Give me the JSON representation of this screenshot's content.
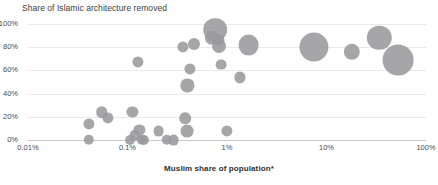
{
  "chart_data": {
    "type": "scatter",
    "title": "Share of Islamic architecture removed",
    "xlabel": "Muslim share of population*",
    "ylabel": "Share of Islamic architecture removed",
    "xscale": "log",
    "xlim": [
      0.01,
      100
    ],
    "ylim": [
      0,
      100
    ],
    "grid": true,
    "legend": "none",
    "xticks": [
      "0.01%",
      "0.1%",
      "1%",
      "10%",
      "100%"
    ],
    "xtick_values": [
      0.01,
      0.1,
      1,
      10,
      100
    ],
    "yticks": [
      "0%",
      "20%",
      "40%",
      "60%",
      "80%",
      "100%"
    ],
    "ytick_values": [
      0,
      20,
      40,
      60,
      80,
      100
    ],
    "marker_color": "#9a9a9c",
    "points": [
      {
        "x": 0.041,
        "y": 0,
        "size": 5.2
      },
      {
        "x": 0.041,
        "y": 14,
        "size": 5.6
      },
      {
        "x": 0.055,
        "y": 24,
        "size": 5.8
      },
      {
        "x": 0.063,
        "y": 19,
        "size": 5.6
      },
      {
        "x": 0.105,
        "y": 0,
        "size": 5.0
      },
      {
        "x": 0.112,
        "y": 24,
        "size": 5.6
      },
      {
        "x": 0.118,
        "y": 4,
        "size": 5.2
      },
      {
        "x": 0.127,
        "y": 67,
        "size": 5.6
      },
      {
        "x": 0.132,
        "y": 9,
        "size": 5.6
      },
      {
        "x": 0.139,
        "y": 0,
        "size": 5.2
      },
      {
        "x": 0.148,
        "y": 0,
        "size": 5.0
      },
      {
        "x": 0.205,
        "y": 8,
        "size": 5.4
      },
      {
        "x": 0.25,
        "y": 0,
        "size": 5.2
      },
      {
        "x": 0.29,
        "y": 0,
        "size": 5.4
      },
      {
        "x": 0.36,
        "y": 80,
        "size": 5.6
      },
      {
        "x": 0.38,
        "y": 19,
        "size": 5.8
      },
      {
        "x": 0.395,
        "y": 8,
        "size": 6.4
      },
      {
        "x": 0.4,
        "y": 47,
        "size": 6.6
      },
      {
        "x": 0.42,
        "y": 61,
        "size": 5.6
      },
      {
        "x": 0.47,
        "y": 83,
        "size": 6.0
      },
      {
        "x": 0.7,
        "y": 88,
        "size": 7.2
      },
      {
        "x": 0.76,
        "y": 95,
        "size": 11.8
      },
      {
        "x": 0.82,
        "y": 86,
        "size": 5.6
      },
      {
        "x": 0.84,
        "y": 81,
        "size": 7.0
      },
      {
        "x": 0.88,
        "y": 65,
        "size": 5.4
      },
      {
        "x": 1.0,
        "y": 8,
        "size": 5.6
      },
      {
        "x": 1.35,
        "y": 54,
        "size": 5.6
      },
      {
        "x": 1.65,
        "y": 82,
        "size": 10.4
      },
      {
        "x": 7.5,
        "y": 80,
        "size": 14.6
      },
      {
        "x": 18.0,
        "y": 76,
        "size": 8.2
      },
      {
        "x": 34.0,
        "y": 88,
        "size": 12.2
      },
      {
        "x": 52.0,
        "y": 69,
        "size": 15.4
      }
    ]
  }
}
